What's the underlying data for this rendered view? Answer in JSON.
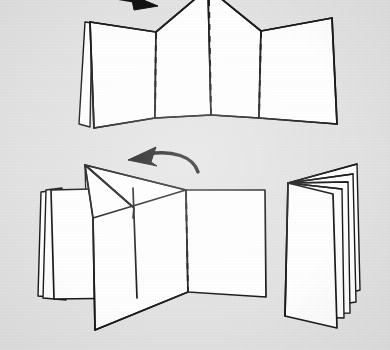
{
  "page": {
    "width": 390,
    "height": 350,
    "background_color": "#e3e3e3",
    "ink_color": "#1a1a1a",
    "paper_color": "#ffffff",
    "medium": "scanned line-art instructional illustration"
  },
  "figures": [
    {
      "id": "figure-top",
      "name": "accordion-folded-strip",
      "caption": "",
      "description": "Long paper strip standing on edge, zig-zag accordion folded into panels, seen in perspective from above. Three vertical dashed fold lines mark further creases. A thin flap leans at the far left. The central peak is cropped off the top edge of the image.",
      "panel_count": 4,
      "dashed_crease_count": 3,
      "cropped_at_top": true
    },
    {
      "id": "figure-bottom-left",
      "name": "folding-panels-together",
      "caption": "",
      "description": "The accordion partly collapsed: a stack of panels at the left, a triangular flap pointing up-right, an open panel in the middle and a large panel at the right with a single vertical dashed crease.",
      "dashed_crease_count": 1
    },
    {
      "id": "figure-bottom-right",
      "name": "finished-folded-book",
      "caption": "",
      "description": "Completed result: the strip closed into a small book of stacked leaves standing open at a narrow angle, spine at the upper left, several page edges fanned at the top.",
      "leaf_count": 4
    }
  ],
  "arrows": [
    {
      "id": "arrow-top",
      "name": "fold-direction-arrow-top",
      "shape": "straight",
      "direction": "right",
      "points_to": "figure-top",
      "cropped": true
    },
    {
      "id": "arrow-middle",
      "name": "fold-direction-arrow-middle",
      "shape": "curved",
      "direction": "left",
      "points_to": "figure-bottom-left",
      "cropped": false
    }
  ],
  "colors": {
    "background": "#e3e3e3",
    "ink": "#1a1a1a",
    "paper": "#ffffff"
  }
}
